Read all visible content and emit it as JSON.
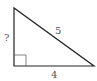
{
  "diagram": {
    "type": "right-triangle",
    "labels": {
      "vertical_leg": "?",
      "hypotenuse": "5",
      "horizontal_leg": "4"
    },
    "colors": {
      "stroke": "#222222",
      "right_angle_marker": "#666666",
      "label": "#555555"
    }
  }
}
